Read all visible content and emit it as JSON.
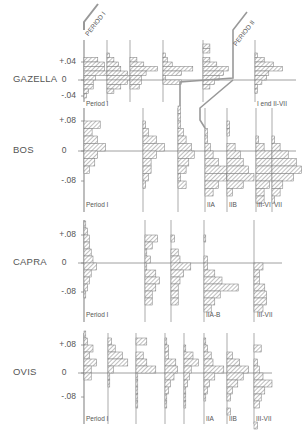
{
  "figure": {
    "period_banners": [
      "PERIOD I",
      "PERIOD II"
    ],
    "hatch_color": "#777777",
    "line_color": "#888888"
  },
  "chart_data": [
    {
      "type": "bar",
      "orientation": "horizontal-histogram",
      "species": "GAZELLA",
      "yticks": [
        "+.04",
        "0",
        "-.04"
      ],
      "ylim": [
        -0.05,
        0.05
      ],
      "bin_width": 0.01,
      "columns": [
        {
          "label": "Period I",
          "bins": {
            "0.04": 6,
            "0.03": 9,
            "0.02": 9,
            "0.01": 12,
            "0.00": 5,
            "-0.01": 4,
            "-0.02": 4,
            "-0.03": 2,
            "-0.04": 1
          }
        },
        {
          "label": "",
          "bins": {
            "0.05": 1,
            "0.04": 3,
            "0.03": 5,
            "0.02": 6,
            "0.01": 9,
            "0.00": 11,
            "-0.01": 9,
            "-0.02": 6,
            "-0.03": 3
          }
        },
        {
          "label": "",
          "bins": {
            "0.04": 3,
            "0.03": 6,
            "0.02": 12,
            "0.01": 7,
            "0.00": 5,
            "-0.01": 5,
            "-0.02": 4
          }
        },
        {
          "label": "",
          "bins": {
            "0.05": 1,
            "0.04": 2,
            "0.03": 4,
            "0.02": 13,
            "0.01": 8,
            "0.00": 1,
            "-0.01": 8
          }
        },
        {
          "label": "",
          "bins": {
            "0.07": 3,
            "0.06": 3,
            "0.04": 3,
            "0.03": 6,
            "0.02": 11,
            "0.01": 9,
            "0.00": 7,
            "-0.01": 5,
            "-0.02": 3
          }
        },
        {
          "label": "I end   II-VII",
          "bins": {
            "0.05": 1,
            "0.04": 4,
            "0.03": 8,
            "0.02": 12,
            "0.01": 6,
            "0.00": 5,
            "-0.01": 3,
            "-0.02": 1,
            "-0.03": 1
          }
        }
      ]
    },
    {
      "type": "bar",
      "orientation": "horizontal-histogram",
      "species": "BOS",
      "yticks": [
        "+.08",
        "0",
        "-.08"
      ],
      "ylim": [
        -0.14,
        0.12
      ],
      "bin_width": 0.02,
      "columns": [
        {
          "label": "Period I",
          "bins": {
            "0.06": 6,
            "0.04": 3,
            "0.02": 5,
            "0.00": 8,
            "-0.02": 5,
            "-0.04": 4,
            "-0.06": 2
          }
        },
        {
          "label": "",
          "bins": {
            "0.06": 1,
            "0.04": 2,
            "0.02": 5,
            "0.00": 8,
            "-0.02": 5,
            "-0.04": 3,
            "-0.06": 3,
            "-0.08": 2,
            "-0.10": 1
          }
        },
        {
          "label": "",
          "bins": {
            "0.10": 1,
            "0.08": 1,
            "0.06": 1,
            "0.04": 2,
            "0.02": 3,
            "0.00": 5,
            "-0.02": 6,
            "-0.04": 4,
            "-0.06": 3,
            "-0.08": 1,
            "-0.10": 3
          }
        },
        {
          "label": "IIA",
          "bins": {
            "0.04": 1,
            "0.02": 1,
            "0.00": 2,
            "-0.02": 3,
            "-0.04": 5,
            "-0.06": 10,
            "-0.08": 8,
            "-0.10": 5,
            "-0.12": 3
          }
        },
        {
          "label": "IIB",
          "bins": {
            "0.06": 1,
            "0.04": 1,
            "0.00": 3,
            "-0.02": 5,
            "-0.04": 6,
            "-0.06": 8,
            "-0.08": 10,
            "-0.10": 6,
            "-0.12": 2
          }
        },
        {
          "label": "III-VI",
          "bins": {
            "0.02": 1,
            "0.00": 3,
            "-0.02": 6,
            "-0.04": 8,
            "-0.06": 7,
            "-0.08": 6,
            "-0.10": 5,
            "-0.12": 3,
            "-0.14": 3
          }
        },
        {
          "label": "VII",
          "bins": {
            "0.02": 1,
            "0.00": 3,
            "-0.02": 6,
            "-0.04": 9,
            "-0.06": 11,
            "-0.08": 8,
            "-0.10": 4,
            "-0.12": 3,
            "-0.14": 1
          }
        }
      ]
    },
    {
      "type": "bar",
      "orientation": "horizontal-histogram",
      "species": "CAPRA",
      "yticks": [
        "+.08",
        "0",
        "-.08"
      ],
      "ylim": [
        -0.14,
        0.12
      ],
      "bin_width": 0.02,
      "columns": [
        {
          "label": "Period I",
          "bins": {
            "0.10": 1,
            "0.08": 2,
            "0.06": 3,
            "0.04": 3,
            "0.02": 4,
            "0.00": 5,
            "-0.02": 7,
            "-0.04": 4,
            "-0.06": 3,
            "-0.08": 2,
            "-0.10": 1
          }
        },
        {
          "label": "",
          "bins": {
            "0.06": 7,
            "0.04": 4,
            "0.02": 1,
            "0.00": 3,
            "-0.02": 1,
            "-0.04": 6,
            "-0.06": 8,
            "-0.08": 6,
            "-0.10": 4,
            "-0.12": 4
          }
        },
        {
          "label": "",
          "bins": {
            "0.06": 2,
            "0.02": 4,
            "0.00": 5,
            "-0.02": 11,
            "-0.04": 7,
            "-0.06": 5,
            "-0.08": 4,
            "-0.10": 4,
            "-0.12": 4
          }
        },
        {
          "label": "IIA-B",
          "bins": {
            "0.06": 1,
            "0.00": 2,
            "-0.02": 2,
            "-0.04": 6,
            "-0.06": 10,
            "-0.08": 19,
            "-0.10": 9,
            "-0.12": 6,
            "-0.14": 4
          }
        },
        {
          "label": "III-VII",
          "bins": {
            "-0.02": 5,
            "-0.04": 3,
            "-0.06": 3,
            "-0.08": 6,
            "-0.10": 7,
            "-0.12": 7,
            "-0.14": 5
          }
        }
      ]
    },
    {
      "type": "bar",
      "orientation": "horizontal-histogram",
      "species": "OVIS",
      "yticks": [
        "+.08",
        "0",
        "-.08"
      ],
      "ylim": [
        -0.14,
        0.12
      ],
      "bin_width": 0.02,
      "columns": [
        {
          "label": "Period I",
          "bins": {
            "0.10": 1,
            "0.08": 2,
            "0.06": 5,
            "0.04": 3,
            "0.02": 7,
            "0.00": 4,
            "-0.02": 4
          }
        },
        {
          "label": "",
          "bins": {
            "0.08": 2,
            "0.06": 4,
            "0.04": 8,
            "0.02": 11,
            "0.00": 3,
            "-0.02": 1,
            "-0.04": 1
          }
        },
        {
          "label": "",
          "bins": {
            "0.08": 6,
            "0.04": 4,
            "0.02": 6,
            "0.00": 11,
            "-0.02": 1,
            "-0.04": 1,
            "-0.06": 1,
            "-0.08": 1,
            "-0.10": 1
          }
        },
        {
          "label": "",
          "bins": {
            "0.08": 1,
            "0.06": 2,
            "0.04": 2,
            "0.02": 6,
            "0.00": 7,
            "-0.02": 5,
            "-0.04": 3,
            "-0.06": 2,
            "-0.08": 1,
            "-0.10": 1
          }
        },
        {
          "label": "",
          "bins": {
            "0.06": 1,
            "0.04": 5,
            "0.02": 8,
            "0.00": 4,
            "-0.02": 3,
            "-0.04": 2,
            "-0.06": 1,
            "-0.08": 1,
            "-0.10": 1
          }
        },
        {
          "label": "IIA",
          "bins": {
            "0.08": 1,
            "0.06": 2,
            "0.04": 4,
            "0.02": 5,
            "0.00": 11,
            "-0.02": 6,
            "-0.04": 3,
            "-0.06": 2,
            "-0.08": 1
          }
        },
        {
          "label": "IIB",
          "bins": {
            "0.04": 3,
            "0.02": 7,
            "0.00": 12,
            "-0.02": 9,
            "-0.04": 6,
            "-0.06": 3,
            "-0.08": 2,
            "-0.12": 2
          }
        },
        {
          "label": "III-VII",
          "bins": {
            "0.06": 4,
            "0.02": 2,
            "0.00": 3,
            "-0.02": 5,
            "-0.04": 10,
            "-0.06": 6,
            "-0.08": 4,
            "-0.10": 3,
            "-0.16": 2
          }
        }
      ]
    }
  ]
}
